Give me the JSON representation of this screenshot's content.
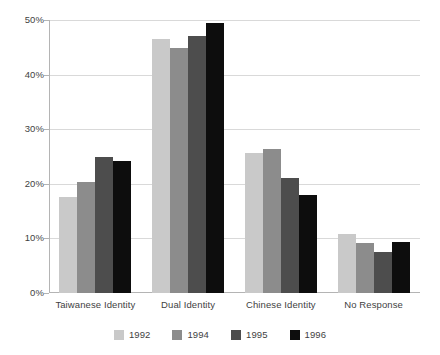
{
  "chart_data": {
    "type": "bar",
    "title": "",
    "subtitle": "",
    "xlabel": "",
    "ylabel": "",
    "categories": [
      "Taiwanese Identity",
      "Dual Identity",
      "Chinese Identity",
      "No Response"
    ],
    "series": [
      {
        "name": "1992",
        "color": "#c9c9c9",
        "values": [
          17.6,
          46.5,
          25.7,
          10.9
        ]
      },
      {
        "name": "1994",
        "color": "#8c8c8c",
        "values": [
          20.3,
          44.8,
          26.4,
          9.2
        ]
      },
      {
        "name": "1995",
        "color": "#4d4d4d",
        "values": [
          24.9,
          47.1,
          21.1,
          7.6
        ]
      },
      {
        "name": "1996",
        "color": "#0d0d0d",
        "values": [
          24.1,
          49.4,
          17.9,
          9.4
        ]
      }
    ],
    "ylim": [
      0,
      50
    ],
    "yticks": [
      0,
      10,
      20,
      30,
      40,
      50
    ],
    "ytick_labels": [
      "0%",
      "10%",
      "20%",
      "30%",
      "40%",
      "50%"
    ],
    "grid": true,
    "legend_position": "bottom",
    "axis_color": "#b4b4b4",
    "gridline_color": "#d9d9d9",
    "background": "#ffffff"
  }
}
